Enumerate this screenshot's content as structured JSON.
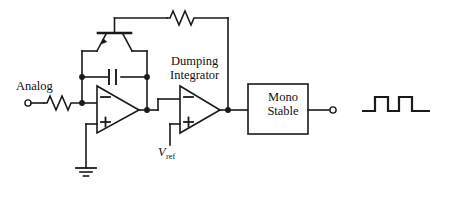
{
  "diagram": {
    "stroke_color": "#1a1a1a",
    "background_color": "#ffffff"
  },
  "labels": {
    "analog_input": "Analog",
    "dumping_line1": "Dumping",
    "dumping_line2": "Integrator",
    "mono_line1": "Mono",
    "mono_line2": "Stable",
    "vref_symbol": "V",
    "vref_subscript": "ref"
  },
  "opamps": [
    {
      "name": "integrator-opamp",
      "inverting_input_sign": "−",
      "noninverting_input_sign": "+"
    },
    {
      "name": "comparator-opamp",
      "inverting_input_sign": "−",
      "noninverting_input_sign": "+"
    }
  ],
  "components": {
    "input_resistor": "resistor-zigzag",
    "feedback_resistor": "resistor-zigzag",
    "integration_capacitor": "capacitor-parallel-plates",
    "reset_switch": "transistor-switch",
    "ground": "ground-symbol",
    "mono_stable_block": "rectangular-block"
  },
  "terminals": {
    "analog_input_terminal": "open-circle",
    "digital_output_terminal": "open-circle"
  },
  "waveform": {
    "name": "digital-pulse-train",
    "type": "square-pulse",
    "pulse_count": 2,
    "description": "Two rectangular output pulses"
  }
}
